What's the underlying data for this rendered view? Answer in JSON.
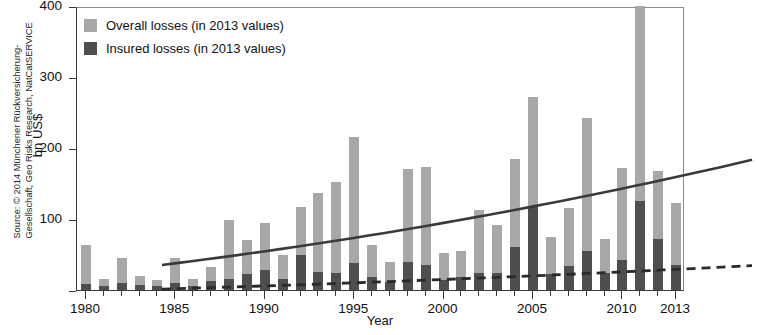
{
  "source": {
    "text": "Source: © 2014 Münchener Rückversicherung-Gesellschaft, Geo Risks Research, NatCatSERVICE"
  },
  "legend": {
    "overall_label": "Overall losses (in 2013 values)",
    "insured_label": "Insured losses (in 2013 values)",
    "overall_color": "#a8a8a8",
    "insured_color": "#4e4e4e",
    "position": "top-left"
  },
  "chart_data": {
    "type": "bar",
    "title": "",
    "xlabel": "Year",
    "ylabel": "bn US$",
    "ylim": [
      0,
      400
    ],
    "yticks": [
      0,
      100,
      200,
      300,
      400
    ],
    "ytick_labels": [
      "",
      "100",
      "200",
      "300",
      "400"
    ],
    "xlim": [
      1979.5,
      2013.5
    ],
    "xticks": [
      1980,
      1985,
      1990,
      1995,
      2000,
      2005,
      2010,
      2013
    ],
    "xtick_labels": [
      "1980",
      "1985",
      "1990",
      "1995",
      "2000",
      "2005",
      "2010",
      "2013"
    ],
    "grid": false,
    "categories": [
      1980,
      1981,
      1982,
      1983,
      1984,
      1985,
      1986,
      1987,
      1988,
      1989,
      1990,
      1991,
      1992,
      1993,
      1994,
      1995,
      1996,
      1997,
      1998,
      1999,
      2000,
      2001,
      2002,
      2003,
      2004,
      2005,
      2006,
      2007,
      2008,
      2009,
      2010,
      2011,
      2012,
      2013
    ],
    "series": [
      {
        "name": "Overall losses (in 2013 values)",
        "color": "#a8a8a8",
        "values": [
          63,
          16,
          45,
          20,
          14,
          45,
          16,
          32,
          98,
          70,
          95,
          50,
          117,
          137,
          152,
          215,
          63,
          40,
          170,
          173,
          52,
          55,
          112,
          92,
          185,
          272,
          75,
          115,
          242,
          72,
          172,
          405,
          168,
          122
        ]
      },
      {
        "name": "Insured losses (in 2013 values)",
        "color": "#4e4e4e",
        "values": [
          8,
          5,
          10,
          7,
          5,
          10,
          6,
          12,
          16,
          22,
          28,
          16,
          50,
          26,
          24,
          38,
          18,
          11,
          40,
          35,
          14,
          18,
          24,
          24,
          60,
          118,
          22,
          34,
          55,
          24,
          42,
          125,
          72,
          35
        ]
      }
    ],
    "annotations": [
      {
        "name": "overall-trend-line",
        "style": "solid",
        "color": "#3a3a3a",
        "from": {
          "x": 1980,
          "y": 48
        },
        "to": {
          "x": 2013,
          "y": 196
        },
        "curve": "convex-upward"
      },
      {
        "name": "insured-trend-line",
        "style": "dashed",
        "color": "#2a2a2a",
        "from": {
          "x": 1980,
          "y": 14
        },
        "to": {
          "x": 2013,
          "y": 47
        },
        "curve": "convex-upward"
      },
      {
        "name": "clipped-bar-2011",
        "note": "2011 overall bar exceeds the 400 axis maximum and is clipped at the top frame"
      }
    ]
  }
}
